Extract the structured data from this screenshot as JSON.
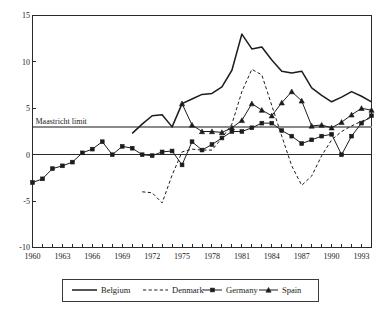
{
  "chart_data": {
    "type": "line",
    "title": "",
    "subtitle": "",
    "xlabel": "",
    "ylabel": "",
    "xlim": [
      1960,
      1994
    ],
    "ylim": [
      -10,
      15
    ],
    "grid": false,
    "legend_position": "bottom-center",
    "y_ticks": [
      "15",
      "10",
      "5",
      "0",
      "-5",
      "-10"
    ],
    "y_tick_values": [
      15,
      10,
      5,
      0,
      -5,
      -10
    ],
    "x_ticks": [
      "1960",
      "1963",
      "1966",
      "1969",
      "1972",
      "1975",
      "1978",
      "1981",
      "1984",
      "1987",
      "1990",
      "1993"
    ],
    "x_tick_values": [
      1960,
      1963,
      1966,
      1969,
      1972,
      1975,
      1978,
      1981,
      1984,
      1987,
      1990,
      1993
    ],
    "x_minor_step": 1,
    "annotations": [
      {
        "label": "Maastricht limit",
        "type": "hline",
        "value": 3,
        "color": "#8a8a8a"
      }
    ],
    "series": [
      {
        "name": "Belgium",
        "style": "solid",
        "marker": "none",
        "color": "#1c1c1c",
        "x": [
          1970,
          1971,
          1972,
          1973,
          1974,
          1975,
          1976,
          1977,
          1978,
          1979,
          1980,
          1981,
          1982,
          1983,
          1984,
          1985,
          1986,
          1987,
          1988,
          1989,
          1990,
          1991,
          1992,
          1993,
          1994
        ],
        "values": [
          2.3,
          3.3,
          4.2,
          4.3,
          3.0,
          5.5,
          6.0,
          6.5,
          6.6,
          7.3,
          9.1,
          13.0,
          11.4,
          11.6,
          10.2,
          9.0,
          8.8,
          9.0,
          7.2,
          6.4,
          5.7,
          6.2,
          6.8,
          6.3,
          5.7
        ]
      },
      {
        "name": "Denmark",
        "style": "dashed",
        "marker": "none",
        "color": "#1c1c1c",
        "x": [
          1971,
          1972,
          1973,
          1974,
          1975,
          1976,
          1977,
          1978,
          1979,
          1980,
          1981,
          1982,
          1983,
          1984,
          1985,
          1986,
          1987,
          1988,
          1989,
          1990,
          1991,
          1992,
          1993,
          1994
        ],
        "values": [
          -4.0,
          -4.1,
          -5.2,
          -2.2,
          0.3,
          0.6,
          0.5,
          0.5,
          1.8,
          3.3,
          6.8,
          9.2,
          8.6,
          5.3,
          2.0,
          -1.2,
          -3.3,
          -2.3,
          -0.1,
          1.6,
          2.5,
          3.1,
          3.6,
          4.0
        ]
      },
      {
        "name": "Germany",
        "style": "solid",
        "marker": "x-square",
        "color": "#1c1c1c",
        "x": [
          1960,
          1961,
          1962,
          1963,
          1964,
          1965,
          1966,
          1967,
          1968,
          1969,
          1970,
          1971,
          1972,
          1973,
          1974,
          1975,
          1976,
          1977,
          1978,
          1979,
          1980,
          1981,
          1982,
          1983,
          1984,
          1985,
          1986,
          1987,
          1988,
          1989,
          1990,
          1991,
          1992,
          1993,
          1994
        ],
        "values": [
          -3.0,
          -2.6,
          -1.5,
          -1.2,
          -0.8,
          0.2,
          0.6,
          1.4,
          0.0,
          0.9,
          0.7,
          0.0,
          -0.1,
          0.3,
          0.4,
          -1.1,
          1.4,
          0.5,
          1.1,
          1.8,
          2.5,
          2.5,
          2.9,
          3.4,
          3.4,
          2.6,
          2.0,
          1.2,
          1.6,
          2.0,
          2.2,
          0.0,
          2.0,
          3.4,
          4.2
        ]
      },
      {
        "name": "Spain",
        "style": "solid",
        "marker": "triangle",
        "color": "#1c1c1c",
        "x": [
          1975,
          1976,
          1977,
          1978,
          1979,
          1980,
          1981,
          1982,
          1983,
          1984,
          1985,
          1986,
          1987,
          1988,
          1989,
          1990,
          1991,
          1992,
          1993,
          1994
        ],
        "values": [
          5.5,
          3.2,
          2.5,
          2.5,
          2.4,
          2.9,
          3.7,
          5.5,
          4.8,
          4.2,
          5.6,
          6.8,
          5.8,
          3.1,
          3.2,
          2.9,
          3.5,
          4.3,
          5.0,
          4.8
        ]
      }
    ]
  },
  "legend": {
    "entries": [
      {
        "label": "Belgium",
        "style": "solid",
        "marker": "none"
      },
      {
        "label": "Denmark",
        "style": "dashed",
        "marker": "none"
      },
      {
        "label": "Germany",
        "style": "solid",
        "marker": "x-square"
      },
      {
        "label": "Spain",
        "style": "solid",
        "marker": "triangle"
      }
    ]
  }
}
